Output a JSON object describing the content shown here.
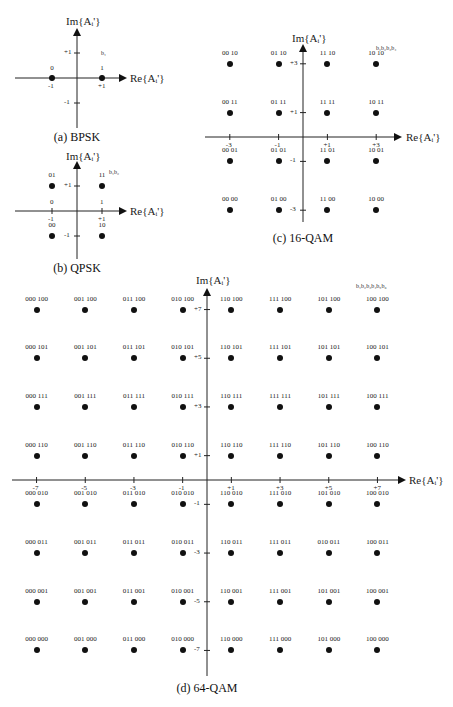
{
  "diagrams": {
    "bpsk": {
      "caption": "(a) BPSK",
      "im_label": "Im{Aᵢ'}",
      "re_label": "Re{Aᵢ'}",
      "bits_label": "b₁",
      "x_ticks": [
        "-1",
        "+1"
      ],
      "y_ticks": [
        "+1",
        "-1"
      ],
      "points": [
        {
          "re": -1,
          "im": 0,
          "label": "0"
        },
        {
          "re": 1,
          "im": 0,
          "label": "1"
        }
      ]
    },
    "qpsk": {
      "caption": "(b) QPSK",
      "im_label": "Im{Aᵢ'}",
      "re_label": "Re{Aᵢ'}",
      "bits_label": "b₁b₂",
      "x_ticks": [
        "-1",
        "+1"
      ],
      "x_tick_bits": [
        "0",
        "1"
      ],
      "y_ticks": [
        "+1",
        "-1"
      ],
      "points": [
        {
          "re": -1,
          "im": 1,
          "label": "01"
        },
        {
          "re": 1,
          "im": 1,
          "label": "11"
        },
        {
          "re": -1,
          "im": -1,
          "label": "00"
        },
        {
          "re": 1,
          "im": -1,
          "label": "10"
        }
      ]
    },
    "qam16": {
      "caption": "(c) 16-QAM",
      "im_label": "Im{Aᵢ'}",
      "re_label": "Re{Aᵢ'}",
      "bits_label": "b₁b₂b₃b₄",
      "x_ticks": [
        "-3",
        "-1",
        "+1",
        "+3"
      ],
      "y_ticks": [
        "+3",
        "+1",
        "-1",
        "-3"
      ],
      "points": [
        {
          "re": -3,
          "im": 3,
          "label": "00 10"
        },
        {
          "re": -1,
          "im": 3,
          "label": "01 10"
        },
        {
          "re": 1,
          "im": 3,
          "label": "11 10"
        },
        {
          "re": 3,
          "im": 3,
          "label": "10 10"
        },
        {
          "re": -3,
          "im": 1,
          "label": "00 11"
        },
        {
          "re": -1,
          "im": 1,
          "label": "01 11"
        },
        {
          "re": 1,
          "im": 1,
          "label": "11 11"
        },
        {
          "re": 3,
          "im": 1,
          "label": "10 11"
        },
        {
          "re": -3,
          "im": -1,
          "label": "00 01"
        },
        {
          "re": -1,
          "im": -1,
          "label": "01 01"
        },
        {
          "re": 1,
          "im": -1,
          "label": "11 01"
        },
        {
          "re": 3,
          "im": -1,
          "label": "10 01"
        },
        {
          "re": -3,
          "im": -3,
          "label": "00 00"
        },
        {
          "re": -1,
          "im": -3,
          "label": "01 00"
        },
        {
          "re": 1,
          "im": -3,
          "label": "11 00"
        },
        {
          "re": 3,
          "im": -3,
          "label": "10 00"
        }
      ]
    },
    "qam64": {
      "caption": "(d) 64-QAM",
      "im_label": "Im{Aᵢ'}",
      "re_label": "Re{Aᵢ'}",
      "bits_label": "b₁b₂b₃b₄b₅b₆",
      "x_ticks": [
        "-7",
        "-5",
        "-3",
        "-1",
        "+1",
        "+3",
        "+5",
        "+7"
      ],
      "y_ticks": [
        "+7",
        "+5",
        "+3",
        "+1",
        "-1",
        "-3",
        "-5",
        "-7"
      ],
      "points": [
        {
          "re": -7,
          "im": 7,
          "label": "000 100"
        },
        {
          "re": -5,
          "im": 7,
          "label": "001 100"
        },
        {
          "re": -3,
          "im": 7,
          "label": "011 100"
        },
        {
          "re": -1,
          "im": 7,
          "label": "010 100"
        },
        {
          "re": 1,
          "im": 7,
          "label": "110 100"
        },
        {
          "re": 3,
          "im": 7,
          "label": "111 100"
        },
        {
          "re": 5,
          "im": 7,
          "label": "101 100"
        },
        {
          "re": 7,
          "im": 7,
          "label": "100 100"
        },
        {
          "re": -7,
          "im": 5,
          "label": "000 101"
        },
        {
          "re": -5,
          "im": 5,
          "label": "001 101"
        },
        {
          "re": -3,
          "im": 5,
          "label": "011 101"
        },
        {
          "re": -1,
          "im": 5,
          "label": "010 101"
        },
        {
          "re": 1,
          "im": 5,
          "label": "110 101"
        },
        {
          "re": 3,
          "im": 5,
          "label": "111 101"
        },
        {
          "re": 5,
          "im": 5,
          "label": "101 101"
        },
        {
          "re": 7,
          "im": 5,
          "label": "100 101"
        },
        {
          "re": -7,
          "im": 3,
          "label": "000 111"
        },
        {
          "re": -5,
          "im": 3,
          "label": "001 111"
        },
        {
          "re": -3,
          "im": 3,
          "label": "011 111"
        },
        {
          "re": -1,
          "im": 3,
          "label": "010 111"
        },
        {
          "re": 1,
          "im": 3,
          "label": "110 111"
        },
        {
          "re": 3,
          "im": 3,
          "label": "111 111"
        },
        {
          "re": 5,
          "im": 3,
          "label": "101 111"
        },
        {
          "re": 7,
          "im": 3,
          "label": "100 111"
        },
        {
          "re": -7,
          "im": 1,
          "label": "000 110"
        },
        {
          "re": -5,
          "im": 1,
          "label": "001 110"
        },
        {
          "re": -3,
          "im": 1,
          "label": "011 110"
        },
        {
          "re": -1,
          "im": 1,
          "label": "010 110"
        },
        {
          "re": 1,
          "im": 1,
          "label": "110 110"
        },
        {
          "re": 3,
          "im": 1,
          "label": "111 110"
        },
        {
          "re": 5,
          "im": 1,
          "label": "101 110"
        },
        {
          "re": 7,
          "im": 1,
          "label": "100 110"
        },
        {
          "re": -7,
          "im": -1,
          "label": "000 010"
        },
        {
          "re": -5,
          "im": -1,
          "label": "001 010"
        },
        {
          "re": -3,
          "im": -1,
          "label": "011 010"
        },
        {
          "re": -1,
          "im": -1,
          "label": "010 010"
        },
        {
          "re": 1,
          "im": -1,
          "label": "110 010"
        },
        {
          "re": 3,
          "im": -1,
          "label": "111 010"
        },
        {
          "re": 5,
          "im": -1,
          "label": "101 010"
        },
        {
          "re": 7,
          "im": -1,
          "label": "100 010"
        },
        {
          "re": -7,
          "im": -3,
          "label": "000 011"
        },
        {
          "re": -5,
          "im": -3,
          "label": "001 011"
        },
        {
          "re": -3,
          "im": -3,
          "label": "011 011"
        },
        {
          "re": -1,
          "im": -3,
          "label": "010 011"
        },
        {
          "re": 1,
          "im": -3,
          "label": "110 011"
        },
        {
          "re": 3,
          "im": -3,
          "label": "111 011"
        },
        {
          "re": 5,
          "im": -3,
          "label": "010 011"
        },
        {
          "re": 7,
          "im": -3,
          "label": "100 011"
        },
        {
          "re": -7,
          "im": -5,
          "label": "000 001"
        },
        {
          "re": -5,
          "im": -5,
          "label": "001 001"
        },
        {
          "re": -3,
          "im": -5,
          "label": "011 001"
        },
        {
          "re": -1,
          "im": -5,
          "label": "010 001"
        },
        {
          "re": 1,
          "im": -5,
          "label": "110 001"
        },
        {
          "re": 3,
          "im": -5,
          "label": "111 001"
        },
        {
          "re": 5,
          "im": -5,
          "label": "101 001"
        },
        {
          "re": 7,
          "im": -5,
          "label": "100 001"
        },
        {
          "re": -7,
          "im": -7,
          "label": "000 000"
        },
        {
          "re": -5,
          "im": -7,
          "label": "001 000"
        },
        {
          "re": -3,
          "im": -7,
          "label": "011 000"
        },
        {
          "re": -1,
          "im": -7,
          "label": "010 000"
        },
        {
          "re": 1,
          "im": -7,
          "label": "110 000"
        },
        {
          "re": 3,
          "im": -7,
          "label": "111 000"
        },
        {
          "re": 5,
          "im": -7,
          "label": "101 000"
        },
        {
          "re": 7,
          "im": -7,
          "label": "100 000"
        }
      ]
    }
  }
}
